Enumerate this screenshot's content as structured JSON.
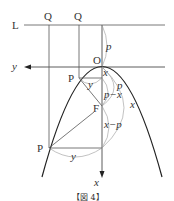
{
  "figure": {
    "caption": "【図 4】",
    "labels": {
      "L": "L",
      "Q1": "Q",
      "Q2": "Q",
      "O": "O",
      "y_axis": "y",
      "x_axis": "x",
      "P_upper": "P",
      "P_lower": "P",
      "F": "F",
      "p_top": "p",
      "x_small": "x",
      "y_upper": "y",
      "p_mid": "p",
      "p_minus_x": "p−x",
      "x_arc": "x",
      "x_minus_p": "x−p",
      "y_lower": "y"
    }
  }
}
